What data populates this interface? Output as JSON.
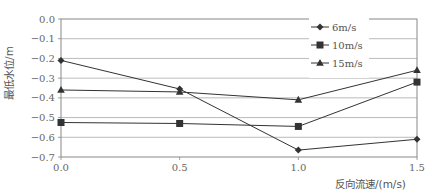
{
  "chart_data": {
    "type": "line",
    "title": "",
    "xlabel": "反向流速/(m/s)",
    "ylabel": "最低水位/m",
    "x": [
      0.0,
      0.5,
      1.0,
      1.5
    ],
    "x_tick_labels": [
      "0.0",
      "0.5",
      "1.0",
      "1.5"
    ],
    "y_tick_values": [
      0.0,
      -0.1,
      -0.2,
      -0.3,
      -0.4,
      -0.5,
      -0.6,
      -0.7
    ],
    "y_tick_labels": [
      "0.0",
      "−0.1",
      "−0.2",
      "−0.3",
      "−0.4",
      "−0.5",
      "−0.6",
      "−0.7"
    ],
    "xlim": [
      0.0,
      1.5
    ],
    "ylim": [
      -0.7,
      0.0
    ],
    "grid": "horizontal",
    "legend_position": "upper right (inside)",
    "series": [
      {
        "name": "6m/s",
        "marker": "diamond",
        "values": [
          -0.21,
          -0.355,
          -0.665,
          -0.61
        ]
      },
      {
        "name": "10m/s",
        "marker": "square",
        "values": [
          -0.525,
          -0.53,
          -0.545,
          -0.32
        ]
      },
      {
        "name": "15m/s",
        "marker": "triangle",
        "values": [
          -0.36,
          -0.37,
          -0.41,
          -0.26
        ]
      }
    ]
  },
  "colors": {
    "line": "#333333",
    "grid": "#aaaaaa",
    "frame": "#888888"
  }
}
